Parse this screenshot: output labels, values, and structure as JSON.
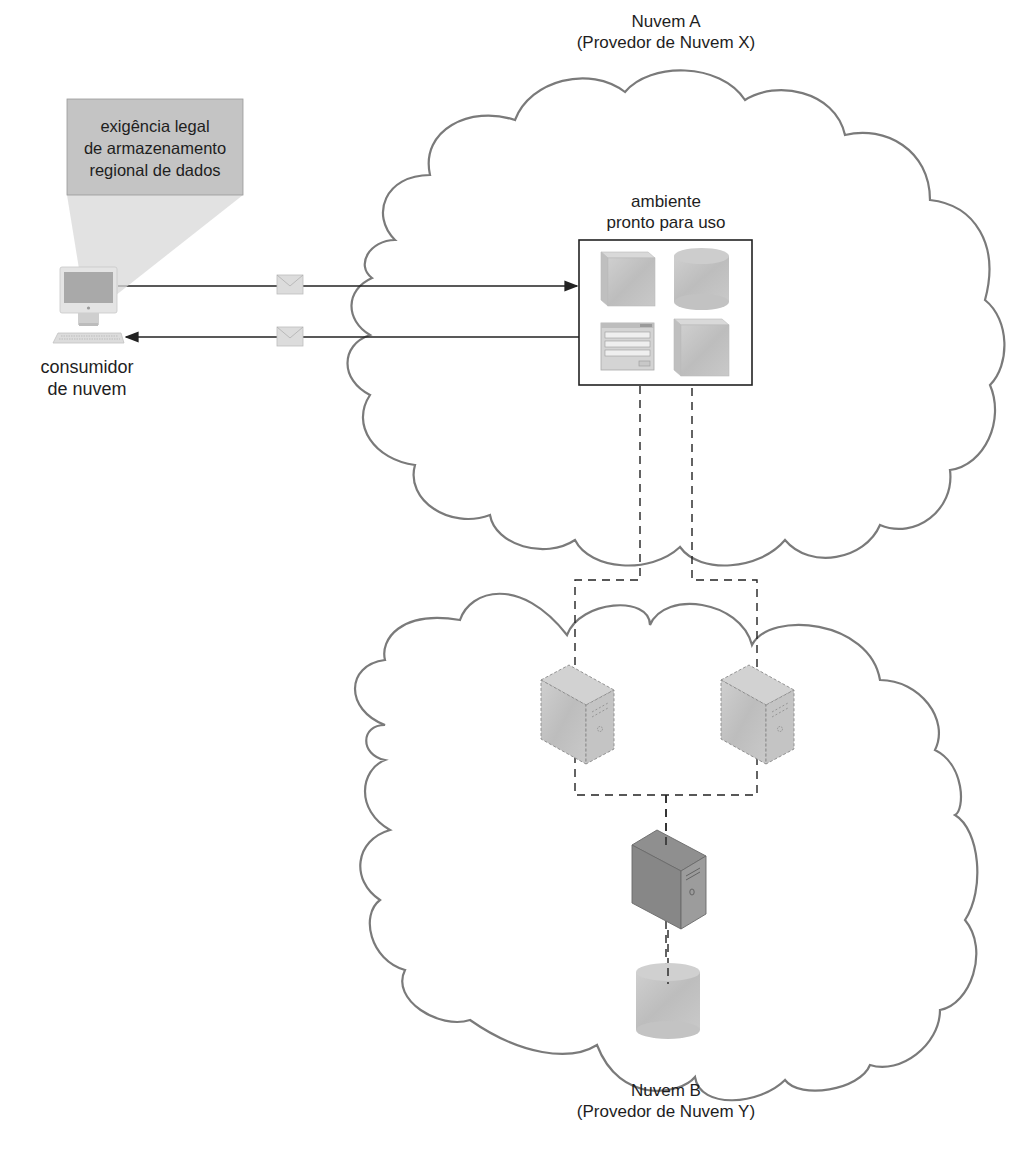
{
  "diagram": {
    "type": "cloud-architecture",
    "cloud_a": {
      "title": "Nuvem A",
      "subtitle": "(Provedor de Nuvem X)"
    },
    "cloud_b": {
      "title": "Nuvem B",
      "subtitle": "(Provedor de Nuvem Y)"
    },
    "environment": {
      "line1": "ambiente",
      "line2": "pronto para uso",
      "icons": [
        "virtual-server-cube-icon",
        "database-cylinder-icon",
        "form-window-icon",
        "virtual-server-cube-icon"
      ]
    },
    "consumer": {
      "line1": "consumidor",
      "line2": "de nuvem",
      "icon": "workstation-icon"
    },
    "callout": {
      "line1": "exigência legal",
      "line2": "de armazenamento",
      "line3": "regional de dados"
    },
    "messages": [
      {
        "direction": "consumer-to-environment",
        "icon": "envelope-icon"
      },
      {
        "direction": "environment-to-consumer",
        "icon": "envelope-icon"
      }
    ],
    "cloud_b_nodes": [
      {
        "type": "virtual-server",
        "style": "dashed",
        "icon": "server-tower-icon"
      },
      {
        "type": "virtual-server",
        "style": "dashed",
        "icon": "server-tower-icon"
      },
      {
        "type": "physical-server",
        "style": "solid",
        "icon": "server-tower-icon"
      },
      {
        "type": "storage",
        "style": "solid",
        "icon": "database-cylinder-icon"
      }
    ],
    "colors": {
      "cloud_stroke": "#7a7a7a",
      "box_stroke": "#222222",
      "icon_fill": "#c8c8c8",
      "icon_dark_fill": "#8a8a8a",
      "callout_fill": "#c4c4c4",
      "background": "#ffffff"
    }
  }
}
